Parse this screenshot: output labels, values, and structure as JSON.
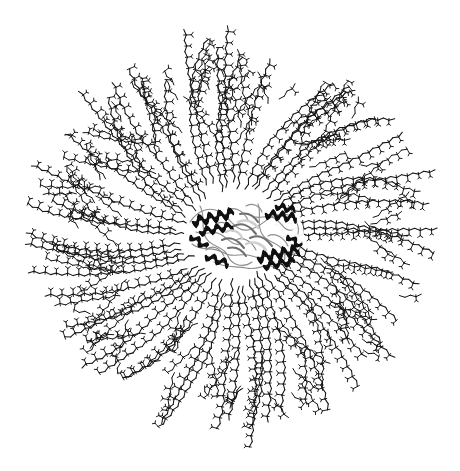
{
  "figure": {
    "domain": "Natural-Image",
    "kind": "scientific-structural-illustration",
    "title": "",
    "caption": "",
    "background_color": "#ffffff",
    "width": 460,
    "height": 471,
    "has_text_labels": false,
    "has_axes": false,
    "has_legend": false
  },
  "top_rule": {
    "present": true,
    "y": 4,
    "x_start": 0,
    "x_end": 460,
    "thickness": 1,
    "color": "#9a9a9a"
  },
  "corona": {
    "name": "polymer-dendrimer-corona",
    "description": "radial brush of stick-model polymer chains emanating from the central protein",
    "center_x": 232,
    "center_y": 236,
    "inner_radius": 48,
    "outer_radius": 214,
    "arm_count": 52,
    "spiral_twist_deg": 26,
    "branch_levels": 2,
    "stroke_color": "#141414",
    "stroke_width": 1.05,
    "pendant_stroke_width": 0.95,
    "zigzag_segment_px": 5.6,
    "zigzag_amplitude_px": 2.1,
    "pendant_every_n_segments": 2,
    "pendant_length_px": 4.4,
    "radius_jitter": 0.17,
    "angle_jitter_deg": 3.2
  },
  "protein": {
    "name": "protein-ribbon-cartoon",
    "description": "central protein rendered as a cartoon/ribbon model with alpha-helices and loops",
    "center_x": 244,
    "center_y": 234,
    "bbox": {
      "x": 188,
      "y": 200,
      "width": 114,
      "height": 70
    },
    "helix_color": "#101010",
    "sheet_color": "#6f6f6f",
    "loop_color": "#8e8e8e",
    "highlight_color": "#cfcfcf",
    "helix_count": 9,
    "loop_count": 14,
    "representation": "cartoon"
  },
  "colors": {
    "ink": "#141414",
    "rule": "#9a9a9a",
    "paper": "#ffffff",
    "protein_dark": "#101010",
    "protein_mid": "#6f6f6f",
    "protein_light": "#b9b9b9"
  }
}
